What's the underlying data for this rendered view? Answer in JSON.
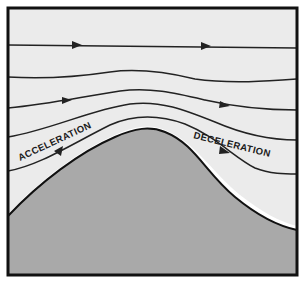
{
  "diagram": {
    "labels": {
      "acceleration": "ACCELERATION",
      "deceleration": "DECELERATION"
    },
    "colors": {
      "sky": "#ebebeb",
      "ground": "#a9a9a9",
      "ground_highlight": "#ffffff",
      "streamline": "#222222",
      "frame": "#111111"
    },
    "elements": {
      "frame": "thick black rectangular border",
      "streamlines": [
        {
          "id": 1,
          "shape": "straight",
          "arrows": 2
        },
        {
          "id": 2,
          "shape": "slight bump",
          "arrows": 0
        },
        {
          "id": 3,
          "shape": "bump over hill",
          "arrows": 2
        },
        {
          "id": 4,
          "shape": "stronger bump",
          "arrows": 0
        },
        {
          "id": 5,
          "shape": "follows hill contour",
          "arrows": 2
        }
      ],
      "hill": "gray terrain rising from left, peak near center, descending to right"
    }
  }
}
